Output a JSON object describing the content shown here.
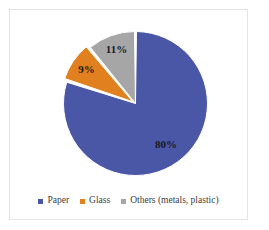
{
  "chart_data": {
    "type": "pie",
    "title": "",
    "subtitle": "",
    "xlabel": "",
    "ylabel": "",
    "grid": false,
    "legend_position": "bottom",
    "start_angle_deg": 0,
    "direction": "clockwise",
    "categories": [
      "Paper",
      "Glass",
      "Others (metals, plastic)"
    ],
    "values": [
      80,
      9,
      11
    ],
    "value_unit": "%",
    "data_labels": [
      "80%",
      "9%",
      "11%"
    ],
    "colors": [
      "#4a56a6",
      "#e0801f",
      "#a6a6a6"
    ],
    "slices": [
      {
        "label": "Paper",
        "value": 80,
        "data_label": "80%",
        "color": "#4a56a6",
        "start_deg": 0,
        "sweep_deg": 288,
        "exploded": false
      },
      {
        "label": "Glass",
        "value": 9,
        "data_label": "9%",
        "color": "#e0801f",
        "start_deg": 288,
        "sweep_deg": 32.4,
        "exploded": true
      },
      {
        "label": "Others (metals, plastic)",
        "value": 11,
        "data_label": "11%",
        "color": "#a6a6a6",
        "start_deg": 320.4,
        "sweep_deg": 39.6,
        "exploded": false
      }
    ]
  },
  "legend": {
    "items": [
      {
        "label": "Paper",
        "color": "#4a56a6"
      },
      {
        "label": "Glass",
        "color": "#e0801f"
      },
      {
        "label": "Others (metals, plastic)",
        "color": "#a6a6a6"
      }
    ]
  },
  "style": {
    "background": "#ffffff",
    "frame_border": "#e3e3e3",
    "slice_separator": "#ffffff",
    "label_text": "#1a1a1a",
    "legend_text": "#3d3d3d"
  }
}
